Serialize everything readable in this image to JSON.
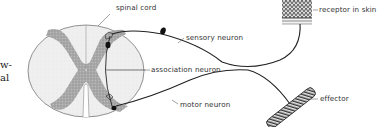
{
  "figure": {
    "caption_fragments": [
      "w-",
      "al"
    ],
    "labels": {
      "spinal_cord": "spinal cord",
      "sensory_neuron": "sensory neuron",
      "association_neuron": "association neuron",
      "motor_neuron": "motor neuron",
      "receptor": "receptor in skin",
      "effector": "effector"
    },
    "colors": {
      "ink": "#222222",
      "gray_matter": "#a8a8a8",
      "white_matter": "#eeeeee",
      "label_text": "#333333"
    }
  }
}
